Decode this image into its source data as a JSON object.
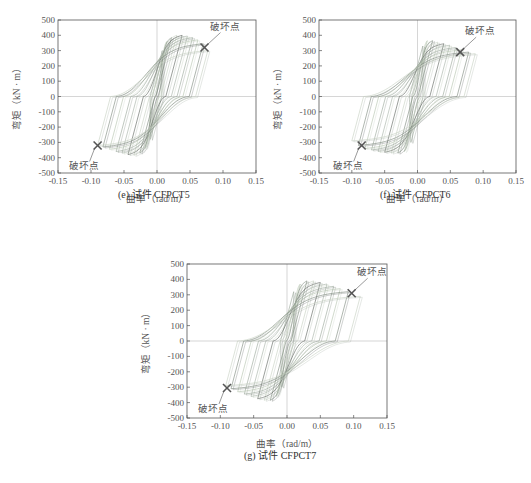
{
  "figure": {
    "panels": [
      {
        "id": "e",
        "caption": "(e) 试件 CFPCT5",
        "xlabel": "曲率（rad/m）",
        "ylabel": "弯矩（kN · m）",
        "annotation": "破坏点",
        "plot_box": {
          "left": 58,
          "top": 20,
          "right": 256,
          "bottom": 173
        },
        "caption_pos": {
          "x": 118,
          "y": 193
        }
      },
      {
        "id": "f",
        "caption": "(f) 试件 CFPCT6",
        "xlabel": "曲率（rad/m）",
        "ylabel": "弯矩（kN · m）",
        "annotation": "破坏点",
        "plot_box": {
          "left": 319,
          "top": 20,
          "right": 516,
          "bottom": 173
        },
        "caption_pos": {
          "x": 380,
          "y": 193
        }
      },
      {
        "id": "g",
        "caption": "(g) 试件 CFPCT7",
        "xlabel": "曲率（rad/m）",
        "ylabel": "弯矩（kN · m）",
        "annotation": "破坏点",
        "plot_box": {
          "left": 187,
          "top": 264,
          "right": 387,
          "bottom": 418
        },
        "caption_pos": {
          "x": 244,
          "y": 455
        }
      }
    ]
  },
  "chart_data": [
    {
      "type": "line",
      "title": "(e) 试件 CFPCT5",
      "xlabel": "曲率（rad/m）",
      "ylabel": "弯矩（kN · m）",
      "xlim": [
        -0.15,
        0.15
      ],
      "ylim": [
        -500,
        500
      ],
      "xticks": [
        -0.15,
        -0.1,
        -0.05,
        0.0,
        0.05,
        0.1,
        0.15
      ],
      "xtick_labels": [
        "-0.15",
        "-0.10",
        "-0.05",
        "0.00",
        "0.05",
        "0.10",
        "0.15"
      ],
      "yticks": [
        -500,
        -400,
        -300,
        -200,
        -100,
        0,
        100,
        200,
        300,
        400,
        500
      ],
      "grid": false,
      "reference_lines": {
        "x": 0,
        "y": 0
      },
      "description": "Moment-curvature hysteresis loops",
      "series": [
        {
          "name": "hysteresis",
          "positive_peaks_curvature": [
            0.008,
            0.015,
            0.022,
            0.03,
            0.038,
            0.046,
            0.054,
            0.062,
            0.07,
            0.077
          ],
          "positive_peaks_moment": [
            300,
            360,
            385,
            400,
            400,
            395,
            385,
            370,
            345,
            300
          ],
          "negative_peaks_curvature": [
            -0.01,
            -0.018,
            -0.026,
            -0.035,
            -0.044,
            -0.053,
            -0.062,
            -0.072,
            -0.082,
            -0.09
          ],
          "negative_peaks_moment": [
            -280,
            -340,
            -370,
            -385,
            -380,
            -370,
            -360,
            -345,
            -330,
            -320
          ]
        }
      ],
      "annotations": [
        {
          "text": "破坏点",
          "x": 0.072,
          "y": 320,
          "marker": "x"
        },
        {
          "text": "破坏点",
          "x": -0.09,
          "y": -320,
          "marker": "x"
        }
      ]
    },
    {
      "type": "line",
      "title": "(f) 试件 CFPCT6",
      "xlabel": "曲率（rad/m）",
      "ylabel": "弯矩（kN · m）",
      "xlim": [
        -0.15,
        0.15
      ],
      "ylim": [
        -500,
        500
      ],
      "xticks": [
        -0.15,
        -0.1,
        -0.05,
        0.0,
        0.05,
        0.1,
        0.15
      ],
      "xtick_labels": [
        "-0.15",
        "-0.10",
        "-0.05",
        "0.00",
        "0.05",
        "0.10",
        "0.15"
      ],
      "yticks": [
        -500,
        -400,
        -300,
        -200,
        -100,
        0,
        100,
        200,
        300,
        400,
        500
      ],
      "grid": false,
      "reference_lines": {
        "x": 0,
        "y": 0
      },
      "description": "Moment-curvature hysteresis loops",
      "series": [
        {
          "name": "hysteresis",
          "positive_peaks_curvature": [
            0.008,
            0.015,
            0.023,
            0.031,
            0.04,
            0.049,
            0.058,
            0.067,
            0.078,
            0.088
          ],
          "positive_peaks_moment": [
            330,
            365,
            365,
            355,
            345,
            335,
            320,
            305,
            290,
            280
          ],
          "negative_peaks_curvature": [
            -0.01,
            -0.02,
            -0.03,
            -0.04,
            -0.05,
            -0.06,
            -0.07,
            -0.08,
            -0.09,
            -0.1
          ],
          "negative_peaks_moment": [
            -300,
            -360,
            -370,
            -370,
            -365,
            -360,
            -350,
            -340,
            -320,
            -290
          ]
        }
      ],
      "annotations": [
        {
          "text": "破坏点",
          "x": 0.065,
          "y": 290,
          "marker": "x"
        },
        {
          "text": "破坏点",
          "x": -0.085,
          "y": -320,
          "marker": "x"
        }
      ]
    },
    {
      "type": "line",
      "title": "(g) 试件 CFPCT7",
      "xlabel": "曲率（rad/m）",
      "ylabel": "弯矩（kN · m）",
      "xlim": [
        -0.15,
        0.15
      ],
      "ylim": [
        -500,
        500
      ],
      "xticks": [
        -0.15,
        -0.1,
        -0.05,
        0.0,
        0.05,
        0.1,
        0.15
      ],
      "xtick_labels": [
        "-0.15",
        "-0.10",
        "-0.05",
        "0.00",
        "0.05",
        "0.10",
        "0.15"
      ],
      "yticks": [
        -500,
        -400,
        -300,
        -200,
        -100,
        0,
        100,
        200,
        300,
        400,
        500
      ],
      "grid": false,
      "reference_lines": {
        "x": 0,
        "y": 0
      },
      "description": "Moment-curvature hysteresis loops",
      "series": [
        {
          "name": "hysteresis",
          "positive_peaks_curvature": [
            0.01,
            0.02,
            0.03,
            0.04,
            0.05,
            0.06,
            0.07,
            0.08,
            0.092,
            0.11
          ],
          "positive_peaks_moment": [
            320,
            370,
            390,
            390,
            380,
            370,
            355,
            340,
            320,
            290
          ],
          "negative_peaks_curvature": [
            -0.008,
            -0.016,
            -0.025,
            -0.034,
            -0.044,
            -0.054,
            -0.064,
            -0.074,
            -0.084,
            -0.092
          ],
          "negative_peaks_moment": [
            -300,
            -360,
            -385,
            -385,
            -375,
            -360,
            -345,
            -330,
            -310,
            -290
          ]
        }
      ],
      "annotations": [
        {
          "text": "破坏点",
          "x": 0.097,
          "y": 310,
          "marker": "x"
        },
        {
          "text": "破坏点",
          "x": -0.09,
          "y": -305,
          "marker": "x"
        }
      ]
    }
  ],
  "colors": {
    "axis": "#555555",
    "zero_line": "#bbbbbb",
    "curve_palette": [
      "#9aa79a",
      "#b5c4b0",
      "#7f8a80",
      "#c7d0c3",
      "#5f6660",
      "#a8b3a8"
    ],
    "marker": "#555555"
  }
}
